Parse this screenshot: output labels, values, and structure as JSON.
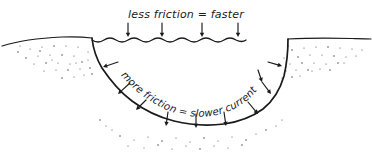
{
  "diagram": {
    "medium": "hand-drawn pen sketch",
    "background_color": "#ffffff",
    "ink_color": "#1a1a1a",
    "stipple_color": "#4a4a4a"
  },
  "labels": {
    "surface_label": "less friction = faster",
    "bed_label": "more friction = slower current"
  },
  "annotations": {
    "surface_arrow_count": 4,
    "surface_arrow_direction": "down",
    "bed_arrow_count": 10,
    "bed_arrow_note": "arrows point outward from water toward channel bed and banks"
  },
  "features": [
    {
      "name": "left-bank-ground",
      "description": "ground surface left of channel with stippled soil"
    },
    {
      "name": "right-bank-ground",
      "description": "ground surface right of channel with stippled soil"
    },
    {
      "name": "water-surface",
      "description": "wavy line across top of channel"
    },
    {
      "name": "channel-bed",
      "description": "U-shaped channel wall and bed outline"
    }
  ],
  "stipple_dots": {
    "left": [
      [
        18,
        52
      ],
      [
        30,
        49
      ],
      [
        42,
        47
      ],
      [
        54,
        46
      ],
      [
        66,
        46
      ],
      [
        78,
        47
      ],
      [
        26,
        58
      ],
      [
        38,
        56
      ],
      [
        50,
        55
      ],
      [
        62,
        55
      ],
      [
        74,
        56
      ],
      [
        34,
        64
      ],
      [
        46,
        63
      ],
      [
        58,
        63
      ],
      [
        70,
        64
      ],
      [
        82,
        62
      ],
      [
        44,
        71
      ],
      [
        56,
        70
      ],
      [
        68,
        70
      ],
      [
        80,
        69
      ],
      [
        88,
        60
      ],
      [
        62,
        78
      ],
      [
        74,
        77
      ],
      [
        84,
        75
      ],
      [
        90,
        68
      ],
      [
        20,
        46
      ],
      [
        88,
        52
      ],
      [
        92,
        74
      ],
      [
        76,
        63
      ],
      [
        52,
        60
      ],
      [
        40,
        51
      ]
    ],
    "right": [
      [
        292,
        50
      ],
      [
        304,
        48
      ],
      [
        316,
        47
      ],
      [
        328,
        47
      ],
      [
        340,
        48
      ],
      [
        352,
        49
      ],
      [
        298,
        57
      ],
      [
        310,
        55
      ],
      [
        322,
        55
      ],
      [
        334,
        56
      ],
      [
        346,
        57
      ],
      [
        290,
        64
      ],
      [
        302,
        63
      ],
      [
        314,
        63
      ],
      [
        326,
        64
      ],
      [
        338,
        63
      ],
      [
        286,
        71
      ],
      [
        296,
        70
      ],
      [
        308,
        70
      ],
      [
        320,
        69
      ],
      [
        282,
        78
      ],
      [
        292,
        77
      ],
      [
        300,
        76
      ],
      [
        284,
        58
      ],
      [
        288,
        46
      ],
      [
        356,
        56
      ],
      [
        362,
        50
      ],
      [
        330,
        70
      ],
      [
        344,
        63
      ],
      [
        312,
        71
      ]
    ],
    "bottom": [
      [
        120,
        136
      ],
      [
        134,
        140
      ],
      [
        148,
        137
      ],
      [
        162,
        141
      ],
      [
        176,
        138
      ],
      [
        190,
        142
      ],
      [
        204,
        138
      ],
      [
        218,
        141
      ],
      [
        232,
        137
      ],
      [
        246,
        140
      ],
      [
        128,
        146
      ],
      [
        144,
        148
      ],
      [
        158,
        145
      ],
      [
        172,
        149
      ],
      [
        186,
        146
      ],
      [
        200,
        149
      ],
      [
        214,
        146
      ],
      [
        228,
        148
      ],
      [
        242,
        145
      ],
      [
        112,
        130
      ],
      [
        256,
        134
      ],
      [
        266,
        130
      ],
      [
        106,
        126
      ],
      [
        276,
        126
      ],
      [
        100,
        120
      ],
      [
        282,
        120
      ]
    ]
  },
  "paths": {
    "left_ground": "M 2 46 C 18 41, 40 38, 62 37 C 74 36.5, 84 37, 92 38",
    "right_ground": "M 288 39 C 308 38, 330 38, 352 38.5 C 362 38.7, 368 38.8, 371 39",
    "water_surface": "M 92 40 q 6 4 12 0 q 6 -4 12 0 q 6 4 12 0 q 6 -4 12 0 q 6 4 12 0 q 6 -4 12 0 q 6 4 12 0 q 6 -4 12 0 q 6 4 12 0 q 6 -4 12 0 q 6 4 12 0 q 6 -4 12 0 q 6 3 10 0",
    "channel": "M 92 38 C 93 48, 96 58, 102 68 C 110 80, 120 92, 132 101 C 144 110, 158 117, 174 121 C 190 125, 208 126, 224 124 C 238 122, 252 117, 263 109 C 273 101, 280 90, 284 76 C 287 63, 288 50, 288 39"
  },
  "surface_arrows": [
    {
      "x": 128,
      "y_top": 23,
      "y_bottom": 37
    },
    {
      "x": 162,
      "y_top": 23,
      "y_bottom": 37
    },
    {
      "x": 202,
      "y_top": 23,
      "y_bottom": 37
    },
    {
      "x": 238,
      "y_top": 23,
      "y_bottom": 37
    }
  ],
  "bed_arrows": [
    {
      "x1": 118,
      "y1": 62,
      "x2": 103,
      "y2": 67,
      "note": "left-upper"
    },
    {
      "x1": 130,
      "y1": 83,
      "x2": 118,
      "y2": 94,
      "note": "left-mid"
    },
    {
      "x1": 146,
      "y1": 100,
      "x2": 136,
      "y2": 110,
      "note": "left-lower"
    },
    {
      "x1": 168,
      "y1": 112,
      "x2": 166,
      "y2": 126,
      "note": "bottom-left"
    },
    {
      "x1": 196,
      "y1": 114,
      "x2": 196,
      "y2": 128,
      "note": "bottom-center"
    },
    {
      "x1": 224,
      "y1": 112,
      "x2": 226,
      "y2": 126,
      "note": "bottom-right"
    },
    {
      "x1": 248,
      "y1": 102,
      "x2": 258,
      "y2": 114,
      "note": "right-lower"
    },
    {
      "x1": 262,
      "y1": 82,
      "x2": 271,
      "y2": 94,
      "note": "right-mid"
    },
    {
      "x1": 268,
      "y1": 62,
      "x2": 282,
      "y2": 66,
      "note": "right-upper"
    },
    {
      "x1": 258,
      "y1": 70,
      "x2": 262,
      "y2": 82,
      "note": "right-inner"
    }
  ]
}
